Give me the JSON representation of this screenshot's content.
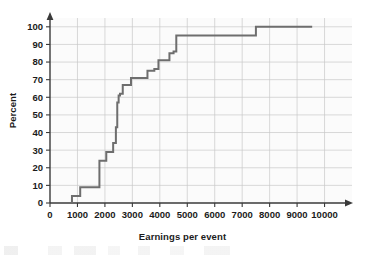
{
  "chart_data": {
    "type": "line",
    "subtype": "step-cumulative-ogive",
    "title": "",
    "xlabel": "Earnings per event",
    "ylabel": "Percent",
    "xlim": [
      0,
      11000
    ],
    "ylim": [
      0,
      105
    ],
    "xticks": [
      0,
      1000,
      2000,
      3000,
      4000,
      5000,
      6000,
      7000,
      8000,
      9000,
      10000
    ],
    "xtick_labels": [
      "0",
      "1000",
      "2000",
      "3000",
      "4000",
      "5000",
      "6000",
      "7000",
      "8000",
      "9000",
      "10000"
    ],
    "yticks": [
      0,
      10,
      20,
      30,
      40,
      50,
      60,
      70,
      80,
      90,
      100
    ],
    "ytick_labels": [
      "0",
      "10",
      "20",
      "30",
      "40",
      "50",
      "60",
      "70",
      "80",
      "90",
      "100"
    ],
    "grid": true,
    "grid_color": "#c9c9c9",
    "legend": "none",
    "line_color": "#6e6e6e",
    "line_width": 2,
    "x": [
      800,
      800,
      1100,
      1100,
      1800,
      1800,
      2050,
      2050,
      2300,
      2300,
      2400,
      2400,
      2450,
      2450,
      2500,
      2500,
      2550,
      2550,
      2650,
      2650,
      2950,
      2950,
      3550,
      3550,
      3800,
      3800,
      3950,
      3950,
      4350,
      4350,
      4500,
      4500,
      4600,
      4600,
      5200,
      5200,
      7500,
      7500,
      9550
    ],
    "y": [
      0,
      4,
      4,
      9,
      9,
      24,
      24,
      29,
      29,
      34,
      34,
      43,
      43,
      57,
      57,
      61,
      61,
      62,
      62,
      67,
      67,
      71,
      71,
      75,
      75,
      76,
      76,
      81,
      81,
      85,
      85,
      86,
      86,
      95,
      95,
      95,
      95,
      100,
      100
    ],
    "steps": [
      {
        "x": 800,
        "percent": 4
      },
      {
        "x": 1100,
        "percent": 9
      },
      {
        "x": 1800,
        "percent": 24
      },
      {
        "x": 2050,
        "percent": 29
      },
      {
        "x": 2300,
        "percent": 34
      },
      {
        "x": 2400,
        "percent": 43
      },
      {
        "x": 2450,
        "percent": 57
      },
      {
        "x": 2500,
        "percent": 61
      },
      {
        "x": 2550,
        "percent": 62
      },
      {
        "x": 2650,
        "percent": 67
      },
      {
        "x": 2950,
        "percent": 71
      },
      {
        "x": 3550,
        "percent": 75
      },
      {
        "x": 3800,
        "percent": 76
      },
      {
        "x": 3950,
        "percent": 81
      },
      {
        "x": 4350,
        "percent": 85
      },
      {
        "x": 4500,
        "percent": 86
      },
      {
        "x": 4600,
        "percent": 95
      },
      {
        "x": 7500,
        "percent": 100
      },
      {
        "x": 9550,
        "percent": 100
      }
    ]
  }
}
